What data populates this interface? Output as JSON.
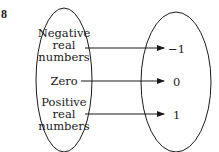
{
  "problem_number": "8",
  "domain_set": {
    "items": [
      {
        "lines": [
          "Negative",
          "real",
          "numbers"
        ]
      },
      {
        "lines": [
          "Zero"
        ]
      },
      {
        "lines": [
          "Positive",
          "real",
          "numbers"
        ]
      }
    ]
  },
  "range_set": {
    "items": [
      "−1",
      "0",
      "1"
    ]
  },
  "mapping": [
    {
      "from": "Negative real numbers",
      "to": "−1"
    },
    {
      "from": "Zero",
      "to": "0"
    },
    {
      "from": "Positive real numbers",
      "to": "1"
    }
  ],
  "colors": {
    "stroke": "#1a1a1a",
    "background": "#ffffff"
  }
}
